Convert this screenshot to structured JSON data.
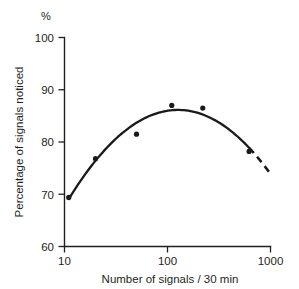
{
  "chart_data": {
    "type": "scatter",
    "title": "",
    "xlabel": "Number of signals / 30 min",
    "ylabel": "Percentage of signals noticed",
    "y_unit_label": "%",
    "xscale": "log",
    "xlim": [
      10,
      1000
    ],
    "ylim": [
      60,
      100
    ],
    "grid": false,
    "legend": null,
    "xticks": [
      "10",
      "100",
      "1000"
    ],
    "xtick_values": [
      10,
      100,
      1000
    ],
    "yticks": [
      "60",
      "70",
      "80",
      "90",
      "100"
    ],
    "ytick_values": [
      60,
      70,
      80,
      90,
      100
    ],
    "x": [
      11,
      20,
      50,
      110,
      220,
      620
    ],
    "values": [
      69.4,
      76.8,
      81.5,
      87.0,
      86.5,
      78.2
    ],
    "series": [
      {
        "name": "Observed data points",
        "x": [
          11,
          20,
          50,
          110,
          220,
          620
        ],
        "values": [
          69.4,
          76.8,
          81.5,
          87.0,
          86.5,
          78.2
        ]
      },
      {
        "name": "Fitted curve (solid)",
        "style": "solid",
        "x_range": [
          11,
          620
        ]
      },
      {
        "name": "Extrapolated curve (dashed)",
        "style": "dashed",
        "x_range": [
          620,
          1000
        ],
        "end_value": 69.4
      }
    ],
    "annotations": []
  },
  "axes": {
    "y_unit": "%",
    "y_title": "Percentage of signals noticed",
    "x_title": "Number of signals / 30 min",
    "y_tick_labels": [
      "100",
      "90",
      "80",
      "70",
      "60"
    ],
    "x_tick_labels": [
      "10",
      "100",
      "1000"
    ]
  }
}
